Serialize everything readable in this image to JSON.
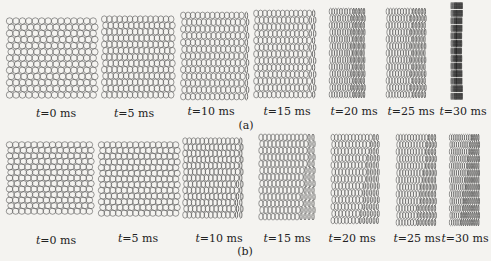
{
  "figure": {
    "rows": [
      {
        "label": "(a)",
        "snapshots": [
          {
            "time": "t=0 ms",
            "compression": 0.0,
            "mode": "uniform"
          },
          {
            "time": "t=5 ms",
            "compression": 0.02,
            "mode": "uniform"
          },
          {
            "time": "t=10 ms",
            "compression": 0.08,
            "mode": "uniform"
          },
          {
            "time": "t=15 ms",
            "compression": 0.12,
            "mode": "uniform"
          },
          {
            "time": "t=20 ms",
            "compression": 0.45,
            "mode": "uniform"
          },
          {
            "time": "t=25 ms",
            "compression": 0.45,
            "mode": "uniform"
          },
          {
            "time": "t=30 ms",
            "compression": 0.85,
            "mode": "uniform"
          }
        ]
      },
      {
        "label": "(b)",
        "snapshots": [
          {
            "time": "t=0 ms",
            "compression": 0.0,
            "mode": "oblique"
          },
          {
            "time": "t=5 ms",
            "compression": 0.03,
            "mode": "oblique"
          },
          {
            "time": "t=10 ms",
            "compression": 0.15,
            "mode": "oblique"
          },
          {
            "time": "t=15 ms",
            "compression": 0.3,
            "mode": "oblique"
          },
          {
            "time": "t=20 ms",
            "compression": 0.45,
            "mode": "oblique"
          },
          {
            "time": "t=25 ms",
            "compression": 0.55,
            "mode": "oblique"
          },
          {
            "time": "t=30 ms",
            "compression": 0.7,
            "mode": "oblique"
          }
        ]
      }
    ],
    "colors": {
      "stroke": "#555555",
      "dense": "#222222",
      "background": "#f4f3f0"
    }
  }
}
